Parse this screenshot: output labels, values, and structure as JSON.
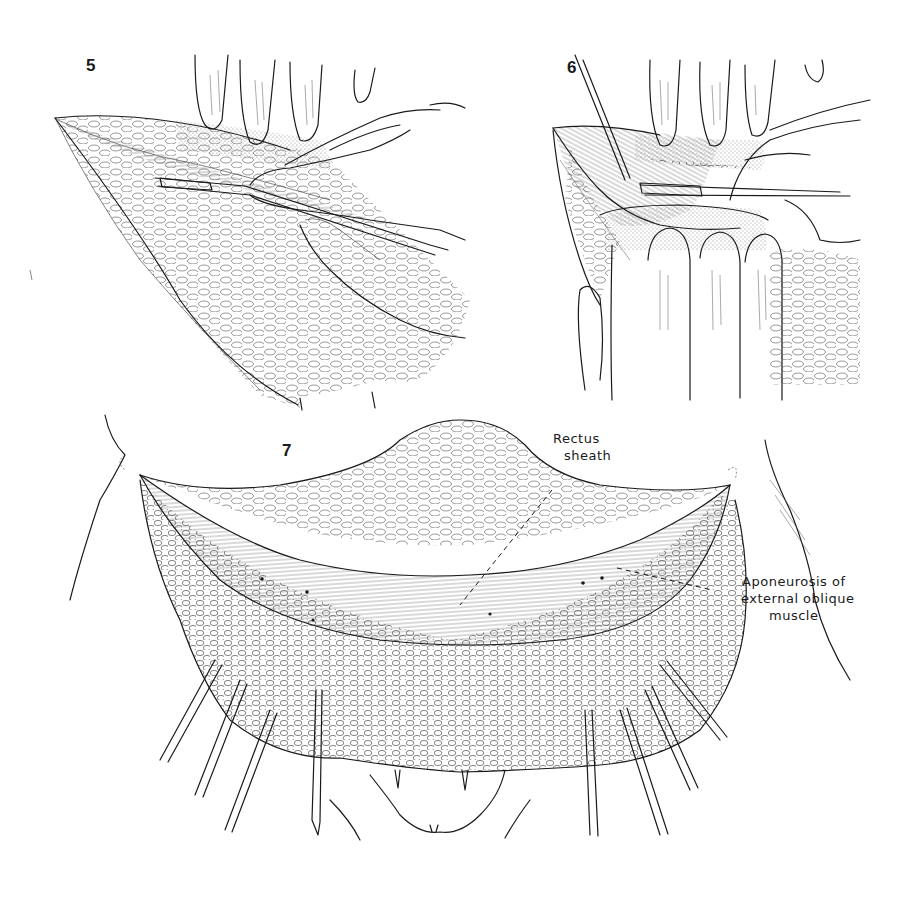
{
  "figure": {
    "panels": [
      {
        "number": "5"
      },
      {
        "number": "6"
      },
      {
        "number": "7"
      }
    ],
    "annotations": {
      "rectus_sheath": {
        "line1": "Rectus",
        "line2": "sheath"
      },
      "aponeurosis": {
        "line1": "Aponeurosis of",
        "line2": "external oblique",
        "line3": "muscle"
      }
    },
    "colors": {
      "ink": "#1a1a1a",
      "background": "#ffffff"
    }
  }
}
